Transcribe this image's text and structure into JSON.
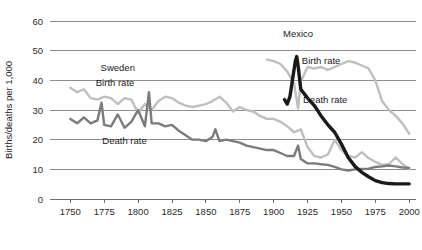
{
  "chart_data": {
    "type": "line",
    "title": "",
    "xlabel": "",
    "ylabel": "Births/deaths per 1,000",
    "xlim": [
      1735,
      2005
    ],
    "ylim": [
      0,
      60
    ],
    "grid": true,
    "legend_position": "inline-annotations",
    "x_ticks": [
      1750,
      1775,
      1800,
      1825,
      1850,
      1875,
      1900,
      1925,
      1950,
      1975,
      2000
    ],
    "y_ticks": [
      0,
      10,
      20,
      30,
      40,
      50,
      60
    ],
    "annotations": [
      {
        "text": "Sweden",
        "x": 1785,
        "y": 43,
        "name": "sweden-country-label"
      },
      {
        "text": "Birth rate",
        "x": 1783,
        "y": 38,
        "name": "sweden-birth-rate-label"
      },
      {
        "text": "Death rate",
        "x": 1790,
        "y": 18.5,
        "name": "sweden-death-rate-label"
      },
      {
        "text": "Mexico",
        "x": 1918,
        "y": 54.5,
        "name": "mexico-country-label"
      },
      {
        "text": "Birth rate",
        "x": 1935,
        "y": 45.5,
        "name": "mexico-birth-rate-label"
      },
      {
        "text": "Death rate",
        "x": 1938,
        "y": 32.5,
        "name": "mexico-death-rate-label"
      }
    ],
    "series": [
      {
        "name": "Sweden birth rate",
        "country": "Sweden",
        "measure": "Birth rate",
        "color": "#bfbfbf",
        "stroke_width": 2.4,
        "x": [
          1750,
          1755,
          1760,
          1765,
          1770,
          1775,
          1780,
          1785,
          1790,
          1795,
          1800,
          1805,
          1810,
          1815,
          1820,
          1825,
          1830,
          1835,
          1840,
          1845,
          1850,
          1855,
          1860,
          1865,
          1870,
          1875,
          1880,
          1885,
          1890,
          1895,
          1900,
          1905,
          1910,
          1915,
          1920,
          1925,
          1930,
          1935,
          1940,
          1945,
          1950,
          1955,
          1960,
          1965,
          1970,
          1975,
          1980,
          1985,
          1990,
          1995,
          2000
        ],
        "y": [
          37.5,
          36.0,
          37.0,
          34.0,
          33.5,
          34.5,
          34.0,
          32.0,
          34.0,
          33.5,
          29.0,
          32.0,
          30.0,
          33.0,
          34.5,
          34.0,
          32.5,
          31.5,
          31.0,
          31.5,
          32.0,
          33.0,
          34.5,
          32.5,
          29.5,
          31.0,
          30.0,
          29.5,
          28.0,
          27.0,
          27.0,
          26.0,
          24.5,
          22.5,
          23.5,
          17.5,
          14.5,
          14.0,
          15.0,
          20.0,
          16.5,
          14.5,
          14.0,
          15.8,
          13.8,
          12.5,
          11.5,
          11.8,
          14.0,
          11.8,
          10.0
        ]
      },
      {
        "name": "Sweden death rate",
        "country": "Sweden",
        "measure": "Death rate",
        "color": "#7b7b7b",
        "stroke_width": 2.4,
        "x": [
          1750,
          1755,
          1760,
          1765,
          1770,
          1773,
          1775,
          1780,
          1785,
          1790,
          1795,
          1800,
          1805,
          1808,
          1810,
          1815,
          1820,
          1825,
          1830,
          1835,
          1840,
          1845,
          1850,
          1855,
          1857,
          1860,
          1865,
          1870,
          1875,
          1880,
          1885,
          1890,
          1895,
          1900,
          1905,
          1910,
          1915,
          1918,
          1920,
          1925,
          1930,
          1935,
          1940,
          1945,
          1950,
          1955,
          1960,
          1965,
          1970,
          1975,
          1980,
          1985,
          1990,
          1995,
          2000
        ],
        "y": [
          27.0,
          25.5,
          27.5,
          25.5,
          26.5,
          32.5,
          25.0,
          24.5,
          28.5,
          24.0,
          26.0,
          30.0,
          24.5,
          36.0,
          25.5,
          25.5,
          24.5,
          25.0,
          23.0,
          21.5,
          20.0,
          20.0,
          19.5,
          21.0,
          23.5,
          19.5,
          20.0,
          19.5,
          19.0,
          18.0,
          17.5,
          17.0,
          16.5,
          16.5,
          15.5,
          14.5,
          14.5,
          18.0,
          13.5,
          12.0,
          12.0,
          11.7,
          11.5,
          10.8,
          10.0,
          9.6,
          10.0,
          10.1,
          10.2,
          10.8,
          11.0,
          11.3,
          11.0,
          10.6,
          10.5
        ]
      },
      {
        "name": "Mexico birth rate",
        "country": "Mexico",
        "measure": "Birth rate",
        "color": "#bfbfbf",
        "stroke_width": 2.4,
        "x": [
          1895,
          1900,
          1905,
          1910,
          1915,
          1918,
          1920,
          1925,
          1930,
          1935,
          1940,
          1945,
          1950,
          1955,
          1960,
          1965,
          1970,
          1975,
          1980,
          1985,
          1990,
          1995,
          2000
        ],
        "y": [
          47.0,
          46.5,
          45.5,
          43.0,
          39.0,
          30.5,
          39.5,
          44.5,
          44.0,
          44.5,
          43.5,
          44.5,
          45.5,
          46.5,
          46.0,
          45.0,
          44.0,
          40.0,
          33.0,
          30.0,
          28.0,
          25.5,
          22.0
        ]
      },
      {
        "name": "Mexico death rate",
        "country": "Mexico",
        "measure": "Death rate",
        "color": "#1a1a1a",
        "stroke_width": 3.4,
        "x": [
          1908,
          1910,
          1912,
          1914,
          1916,
          1917,
          1918,
          1920,
          1925,
          1930,
          1935,
          1940,
          1945,
          1950,
          1955,
          1960,
          1965,
          1970,
          1975,
          1980,
          1985,
          1990,
          1995,
          2000
        ],
        "y": [
          33.5,
          32.0,
          34.5,
          40.5,
          46.5,
          48.0,
          45.0,
          37.0,
          34.0,
          31.5,
          28.0,
          25.0,
          22.5,
          18.5,
          14.0,
          11.0,
          9.0,
          7.5,
          6.2,
          5.5,
          5.2,
          5.1,
          5.1,
          5.1
        ]
      }
    ]
  }
}
